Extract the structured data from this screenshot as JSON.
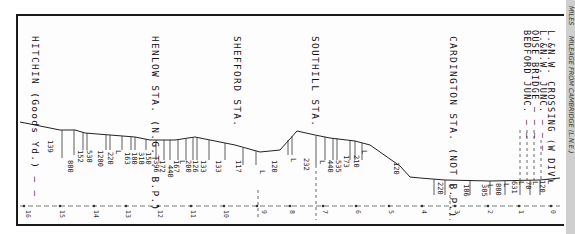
{
  "diagram": {
    "type": "railway-gradient-profile",
    "side_labels": {
      "miles": "MILES",
      "mileage_note": "MILEAGE FROM CAMBRIDGE (L.N.E.)"
    },
    "stations": [
      {
        "id": "hitchin",
        "label": "HITCHIN (Goods Yd.) — —"
      },
      {
        "id": "henlow",
        "label": "HENLOW STA. (N.G.T. B.P.)"
      },
      {
        "id": "shefford",
        "label": "SHEFFORD STA."
      },
      {
        "id": "southill",
        "label": "SOUTHILL STA."
      },
      {
        "id": "cardington",
        "label": "CARDINGTON STA. (NOT B.P.)"
      },
      {
        "id": "bedford_junc",
        "label": "BEDFORD JUNC. — —"
      },
      {
        "id": "ouse_bridge",
        "label": "OUSE BRIDGE — — —"
      },
      {
        "id": "lnw_junc",
        "label": "L.&N.W. JUNC. — — —"
      },
      {
        "id": "lnw_crossing",
        "label": "L.&N.W. CROSSING (W DIV)"
      }
    ],
    "gradients": [
      "139",
      "880",
      "152",
      "538",
      "1280",
      "220",
      "L",
      "163",
      "180",
      "318",
      "150",
      "396",
      "172",
      "440",
      "167",
      "L",
      "200",
      "126",
      "133",
      "133",
      "117",
      "L",
      "120",
      "L",
      "232",
      "L",
      "440",
      "535",
      "173",
      "210",
      "L",
      "120",
      "220",
      "L",
      "186",
      "385",
      "L",
      "880",
      "L",
      "631",
      "L",
      "70",
      "L",
      "120",
      "L"
    ],
    "mileposts": [
      "16",
      "15",
      "14",
      "13",
      "12",
      "11",
      "10",
      "9",
      "8",
      "7",
      "6",
      "5",
      "4",
      "3",
      "2",
      "1",
      "0"
    ]
  }
}
